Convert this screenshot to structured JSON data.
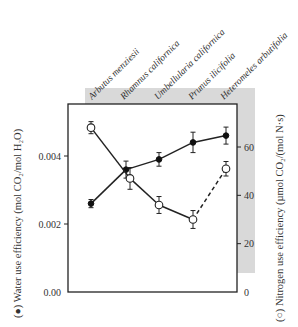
{
  "chart_data": {
    "type": "line",
    "title": "",
    "categories": [
      "Arbutus menziesii",
      "Rhamnus californica",
      "Umbellularia californica",
      "Prunus ilicifolia",
      "Heteromeles arbutifolia"
    ],
    "series": [
      {
        "name": "Water use efficiency",
        "marker": "filled-circle",
        "axis": "left",
        "values": [
          0.0026,
          0.0036,
          0.0039,
          0.0044,
          0.0046
        ],
        "errors": [
          0.00012,
          0.00025,
          0.0002,
          0.0003,
          0.00025
        ],
        "line_style": [
          "solid",
          "solid",
          "solid",
          "solid"
        ]
      },
      {
        "name": "Nitrogen use efficiency",
        "marker": "open-circle",
        "axis": "right",
        "values": [
          68,
          47,
          36,
          30,
          51
        ],
        "errors": [
          2.5,
          4.5,
          3.5,
          3.7,
          3
        ],
        "line_style": [
          "solid",
          "solid",
          "solid",
          "dashed"
        ]
      }
    ],
    "ylabel_left": "(●) Water use efficiency (mol CO₂/mol H₂O)",
    "ylabel_right": "(○) Nitrogen use efficiency (µmol CO₂/(mol N·s)",
    "xlabel": "",
    "ylim_left": [
      0,
      0.0056
    ],
    "ylim_right": [
      0,
      77
    ],
    "yticks_left": [
      "0.00",
      "0.002",
      "0.004"
    ],
    "yticks_right": [
      "0",
      "20",
      "40",
      "60"
    ],
    "grid": false,
    "legend": "none (markers described in axis labels)",
    "background_band": "#d9d9d9"
  },
  "labels": {
    "left_axis": "(●) Water use efficiency (mol CO₂/mol H₂O)",
    "right_axis": "(○) Nitrogen use efficiency (µmol CO₂/(mol N·s)",
    "left_ticks": [
      "0.00",
      "0.002",
      "0.004"
    ],
    "right_ticks": [
      "0",
      "20",
      "40",
      "60"
    ],
    "categories": [
      "Arbutus menziesii",
      "Rhamnus californica",
      "Umbellularia californica",
      "Prunus ilicifolia",
      "Heteromeles arbutifolia"
    ]
  },
  "colors": {
    "band": "#d9d9d9",
    "ink": "#222222",
    "text": "#333333"
  }
}
